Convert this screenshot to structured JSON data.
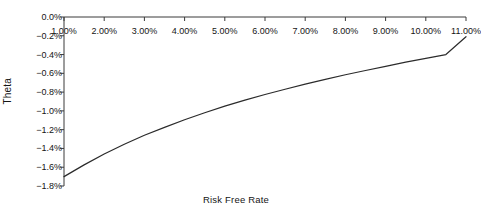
{
  "chart_data": {
    "type": "line",
    "title": "",
    "xlabel": "Risk Free Rate",
    "ylabel": "Theta",
    "grid": false,
    "legend": null,
    "xlim": [
      1.0,
      11.0
    ],
    "ylim": [
      -1.8,
      0.0
    ],
    "x_tick_labels": [
      "1.00%",
      "2.00%",
      "3.00%",
      "4.00%",
      "5.00%",
      "6.00%",
      "7.00%",
      "8.00%",
      "9.00%",
      "10.00%",
      "11.00%"
    ],
    "y_tick_labels": [
      "0.0%",
      "−0.2%",
      "−0.4%",
      "−0.6%",
      "−0.8%",
      "−1.0%",
      "−1.2%",
      "−1.4%",
      "−1.6%",
      "−1.8%"
    ],
    "x_ticks": [
      1,
      2,
      3,
      4,
      5,
      6,
      7,
      8,
      9,
      10,
      11
    ],
    "y_ticks": [
      0.0,
      -0.2,
      -0.4,
      -0.6,
      -0.8,
      -1.0,
      -1.2,
      -1.4,
      -1.6,
      -1.8
    ],
    "series": [
      {
        "name": "Theta",
        "color": "#2b2b2b",
        "x": [
          1.0,
          1.5,
          2.0,
          2.5,
          3.0,
          3.5,
          4.0,
          4.5,
          5.0,
          5.5,
          6.0,
          6.5,
          7.0,
          7.5,
          8.0,
          8.5,
          9.0,
          9.5,
          10.0,
          10.5,
          11.0
        ],
        "y": [
          -1.7,
          -1.575,
          -1.46,
          -1.355,
          -1.26,
          -1.175,
          -1.095,
          -1.02,
          -0.95,
          -0.885,
          -0.825,
          -0.77,
          -0.715,
          -0.665,
          -0.615,
          -0.57,
          -0.525,
          -0.48,
          -0.44,
          -0.4,
          -0.21
        ]
      }
    ]
  },
  "axis_style": {
    "line_color": "#3a3a3a",
    "tick_length": 4
  }
}
